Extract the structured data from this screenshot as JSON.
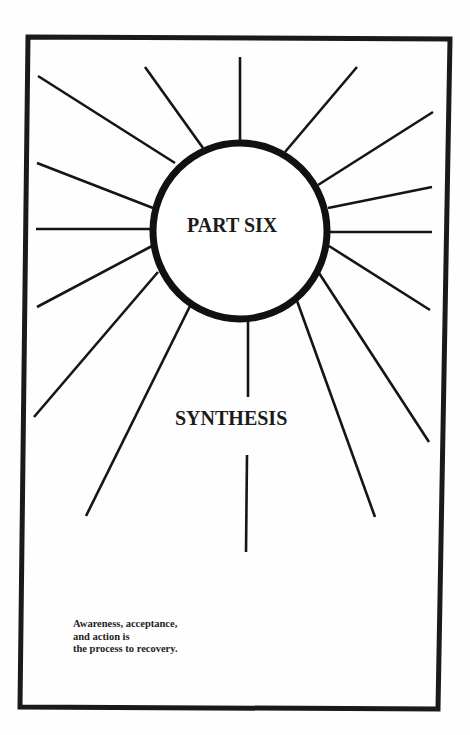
{
  "page": {
    "part_label": "PART SIX",
    "section_title": "SYNTHESIS",
    "caption_lines": [
      "Awareness, acceptance,",
      "and action is",
      "the process to recovery."
    ]
  },
  "graphic": {
    "type": "sunburst-with-circle",
    "frame_color": "#1a1a1a",
    "ray_color": "#151515",
    "circle": {
      "cx": 240,
      "cy": 231,
      "r": 88
    },
    "ray_count": 17
  }
}
